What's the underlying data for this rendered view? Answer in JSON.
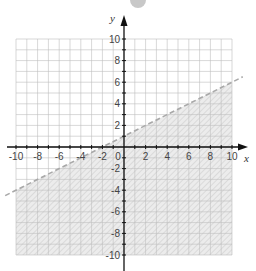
{
  "chart_data": {
    "type": "line",
    "title": "",
    "xlabel": "x",
    "ylabel": "y",
    "xlim": [
      -10,
      10
    ],
    "ylim": [
      -10,
      10
    ],
    "grid": true,
    "grid_step": 1,
    "x_ticks": [
      -10,
      -8,
      -6,
      -4,
      -2,
      0,
      2,
      4,
      6,
      8,
      10
    ],
    "y_ticks": [
      -10,
      -8,
      -6,
      -4,
      -2,
      2,
      4,
      6,
      8,
      10
    ],
    "x_tick_labels": [
      "-10",
      "-8",
      "-6",
      "-4",
      "-2",
      "0",
      "2",
      "4",
      "6",
      "8",
      "10"
    ],
    "y_tick_labels": [
      "-10",
      "-8",
      "-6",
      "-4",
      "-2",
      "2",
      "4",
      "6",
      "8",
      "10"
    ],
    "series": [
      {
        "name": "boundary",
        "equation": "y = 0.5x + 1",
        "style": "dashed",
        "x": [
          -11,
          11
        ],
        "y": [
          -4.5,
          6.5
        ]
      }
    ],
    "shaded_region": {
      "inequality": "y < 0.5x + 1",
      "side": "below",
      "pattern": "hatched"
    },
    "legend": null
  },
  "labels": {
    "x_axis": "x",
    "y_axis": "y",
    "origin": "0"
  },
  "colors": {
    "grid": "#bdbdbd",
    "axis": "#111111",
    "dashed_line": "#a8a8a8",
    "shade": "#e9e9e9",
    "hatch": "#cfcfcf"
  }
}
